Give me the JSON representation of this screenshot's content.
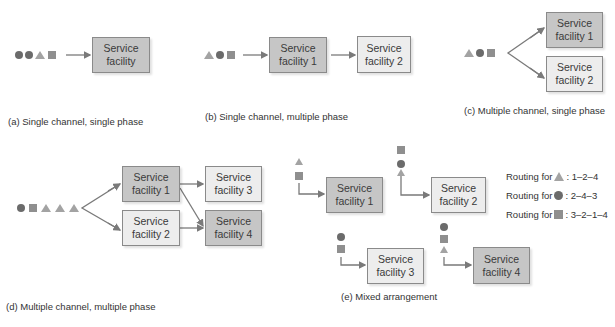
{
  "colors": {
    "circle": "#6b6b6b",
    "triangle": "#a3a3a3",
    "square": "#8f8f8f",
    "box_dark": "#c6c6c6",
    "box_light": "#ededed",
    "arrow": "#7a7a7a"
  },
  "panels": {
    "a": {
      "caption": "(a) Single channel, single phase",
      "queue": [
        "circle",
        "circle",
        "triangle",
        "square"
      ],
      "boxes": [
        {
          "label": "Service\nfacility",
          "line1": "Service",
          "line2": "facility"
        }
      ]
    },
    "b": {
      "caption": "(b) Single channel, multiple phase",
      "queue": [
        "triangle",
        "circle",
        "square"
      ],
      "boxes": [
        {
          "line1": "Service",
          "line2": "facility 1"
        },
        {
          "line1": "Service",
          "line2": "facility 2"
        }
      ]
    },
    "c": {
      "caption": "(c) Multiple channel, single phase",
      "queue": [
        "triangle",
        "circle",
        "square"
      ],
      "boxes": [
        {
          "line1": "Service",
          "line2": "facility 1"
        },
        {
          "line1": "Service",
          "line2": "facility 2"
        }
      ]
    },
    "d": {
      "caption": "(d) Multiple channel, multiple phase",
      "queue": [
        "circle",
        "square",
        "triangle",
        "triangle",
        "triangle"
      ],
      "boxes": [
        {
          "line1": "Service",
          "line2": "facility 1"
        },
        {
          "line1": "Service",
          "line2": "facility 2"
        },
        {
          "line1": "Service",
          "line2": "facility 3"
        },
        {
          "line1": "Service",
          "line2": "facility 4"
        }
      ]
    },
    "e": {
      "caption": "(e) Mixed arrangement",
      "boxes": [
        {
          "line1": "Service",
          "line2": "facility 1",
          "queue": [
            "triangle",
            "square"
          ]
        },
        {
          "line1": "Service",
          "line2": "facility 2",
          "queue": [
            "square",
            "circle",
            "triangle"
          ]
        },
        {
          "line1": "Service",
          "line2": "facility 3",
          "queue": [
            "circle",
            "square"
          ]
        },
        {
          "line1": "Service",
          "line2": "facility 4",
          "queue": [
            "circle",
            "square",
            "triangle"
          ]
        }
      ],
      "routing": [
        {
          "prefix": "Routing for",
          "shape": "triangle",
          "route": ": 1–2–4"
        },
        {
          "prefix": "Routing for",
          "shape": "circle",
          "route": ": 2–4–3"
        },
        {
          "prefix": "Routing for",
          "shape": "square",
          "route": ": 3–2–1–4"
        }
      ]
    }
  }
}
